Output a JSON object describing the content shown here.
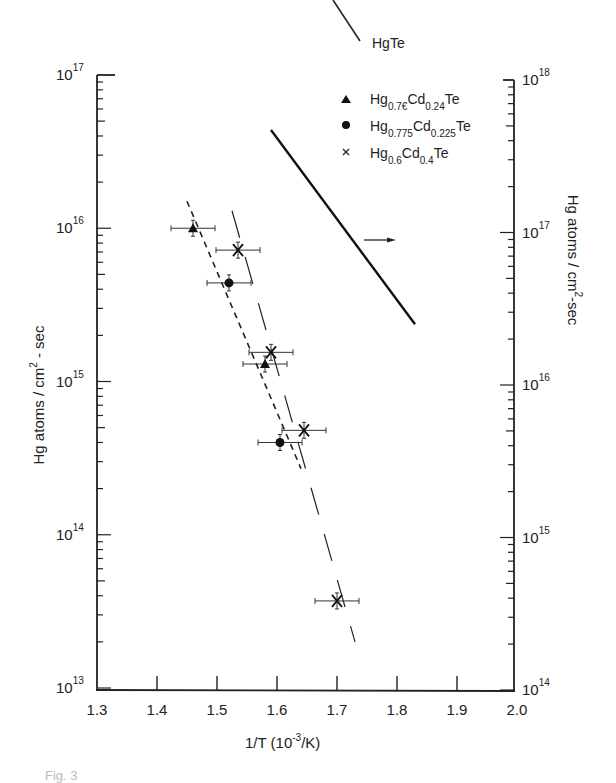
{
  "chart_data": {
    "type": "scatter",
    "title": "",
    "xlabel": "1/T (10^-3/K)",
    "ylabel_left": "Hg atoms / cm^2 - sec",
    "ylabel_right": "Hg atoms / cm^2 - sec",
    "xlim": [
      1.3,
      2.0
    ],
    "ylim_left": [
      10000000000000.0,
      1e+17
    ],
    "ylim_right": [
      100000000000000.0,
      1e+18
    ],
    "yscale": "log",
    "x_ticks": [
      "1.3",
      "1.4",
      "1.5",
      "1.6",
      "1.7",
      "1.8",
      "1.9",
      "2.0"
    ],
    "y_ticks_left": [
      {
        "base": "10",
        "exp": "13"
      },
      {
        "base": "10",
        "exp": "14"
      },
      {
        "base": "10",
        "exp": "15"
      },
      {
        "base": "10",
        "exp": "16"
      },
      {
        "base": "10",
        "exp": "17"
      }
    ],
    "y_ticks_right": [
      {
        "base": "10",
        "exp": "14"
      },
      {
        "base": "10",
        "exp": "15"
      },
      {
        "base": "10",
        "exp": "16"
      },
      {
        "base": "10",
        "exp": "17"
      },
      {
        "base": "10",
        "exp": "18"
      }
    ],
    "grid": false,
    "legend_position": "top-right",
    "series": [
      {
        "name": "HgTe",
        "marker": "line-solid",
        "axis": "right",
        "x": [
          1.59,
          1.83
        ],
        "y": [
          4.7e+17,
          2.5e+16
        ]
      },
      {
        "name": "Hg0.76Cd0.24Te",
        "label_parts": {
          "a": "Hg",
          "a_sub": "0.76",
          "b": "Cd",
          "b_sub": "0.24",
          "c": "Te"
        },
        "marker": "triangle",
        "axis": "left",
        "x": [
          1.46,
          1.58
        ],
        "y": [
          1e+16,
          1300000000000000.0
        ],
        "fit": {
          "style": "short-dash",
          "x": [
            1.45,
            1.64
          ],
          "y": [
            1.5e+16,
            270000000000000.0
          ]
        }
      },
      {
        "name": "Hg0.775Cd0.225Te",
        "label_parts": {
          "a": "Hg",
          "a_sub": "0.775",
          "b": "Cd",
          "b_sub": "0.225",
          "c": "Te"
        },
        "marker": "circle",
        "axis": "left",
        "x": [
          1.52,
          1.605
        ],
        "y": [
          4400000000000000.0,
          400000000000000.0
        ]
      },
      {
        "name": "Hg0.6Cd0.4Te",
        "label_parts": {
          "a": "Hg",
          "a_sub": "0.6",
          "b": "Cd",
          "b_sub": "0.4",
          "c": "Te"
        },
        "marker": "x",
        "axis": "left",
        "x": [
          1.535,
          1.59,
          1.645,
          1.7
        ],
        "y": [
          7200000000000000.0,
          1550000000000000.0,
          480000000000000.0,
          37000000000000.0
        ],
        "fit": {
          "style": "long-dash",
          "x": [
            1.525,
            1.73
          ],
          "y": [
            1.3e+16,
            20000000000000.0
          ]
        }
      }
    ],
    "annotations": [
      {
        "type": "arrow",
        "direction": "right",
        "meaning": "HgTe refers to right axis"
      }
    ]
  },
  "legend": {
    "hgte": "HgTe",
    "s1": {
      "a": "Hg",
      "a_sub": "0.7€",
      "b": "Cd",
      "b_sub": "0.24",
      "c": "Te"
    },
    "s2": {
      "a": "Hg",
      "a_sub": "0.775",
      "b": "Cd",
      "b_sub": "0.225",
      "c": "Te"
    },
    "s3": {
      "a": "Hg",
      "a_sub": "0.6",
      "b": "Cd",
      "b_sub": "0.4",
      "c": "Te"
    }
  },
  "axes": {
    "x_title_a": "1/T (10",
    "x_title_exp": "-3",
    "x_title_b": "/K)",
    "y_left_title_a": "Hg  atoms / cm",
    "y_left_title_exp": "2",
    "y_left_title_b": " - sec",
    "y_right_title_a": "Hg  atoms / cm",
    "y_right_title_exp": "2",
    "y_right_title_b": "-sec"
  },
  "caption": "Fig. 3"
}
